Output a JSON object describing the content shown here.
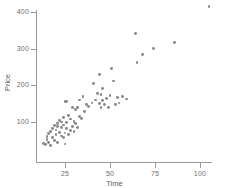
{
  "chart_data": {
    "type": "scatter",
    "title": "",
    "xlabel": "Time",
    "ylabel": "Price",
    "xlim": [
      10,
      112
    ],
    "ylim": [
      20,
      430
    ],
    "xticks": [
      25,
      50,
      75,
      100
    ],
    "xticklabels": [
      "25",
      "50",
      "75",
      "100"
    ],
    "yticks": [
      100,
      200,
      300,
      400
    ],
    "yticklabels": [
      "100",
      "200",
      "300",
      "400"
    ],
    "grid": false,
    "legend": null,
    "marker_color": "#8a8a8a",
    "axis_color": "#9a9a9a",
    "x": [
      13,
      14,
      15,
      15,
      16,
      16,
      17,
      17,
      18,
      18,
      19,
      19,
      20,
      20,
      21,
      21,
      21,
      22,
      22,
      23,
      23,
      23,
      24,
      24,
      24,
      25,
      25,
      25,
      26,
      26,
      26,
      27,
      27,
      28,
      28,
      29,
      29,
      30,
      30,
      31,
      31,
      32,
      32,
      33,
      33,
      34,
      35,
      36,
      37,
      38,
      40,
      41,
      42,
      43,
      44,
      44,
      45,
      45,
      46,
      46,
      47,
      48,
      49,
      50,
      51,
      52,
      53,
      54,
      55,
      57,
      59,
      64,
      65,
      68,
      74,
      86,
      105
    ],
    "y": [
      42,
      38,
      52,
      60,
      45,
      68,
      35,
      75,
      58,
      82,
      50,
      90,
      66,
      78,
      44,
      88,
      96,
      72,
      105,
      62,
      84,
      100,
      58,
      92,
      112,
      40,
      70,
      156,
      82,
      98,
      155,
      65,
      118,
      76,
      108,
      88,
      140,
      74,
      102,
      95,
      135,
      86,
      140,
      115,
      160,
      110,
      170,
      128,
      148,
      142,
      152,
      205,
      160,
      178,
      150,
      230,
      140,
      175,
      158,
      192,
      148,
      165,
      140,
      172,
      245,
      212,
      148,
      167,
      152,
      170,
      163,
      342,
      262,
      285,
      300,
      317,
      415
    ]
  },
  "axis": {
    "x_title": "Time",
    "y_title": "Price"
  }
}
